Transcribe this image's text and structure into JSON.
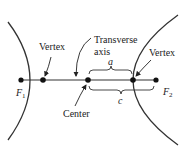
{
  "diagram": {
    "labels": {
      "vertex_left": "Vertex",
      "vertex_right": "Vertex",
      "transverse_line1": "Transverse",
      "transverse_line2": "axis",
      "center": "Center",
      "a": "a",
      "c": "c",
      "f1": "F",
      "f1_sub": "1",
      "f2": "F",
      "f2_sub": "2"
    },
    "colors": {
      "stroke": "#222222",
      "background": "#ffffff"
    }
  }
}
